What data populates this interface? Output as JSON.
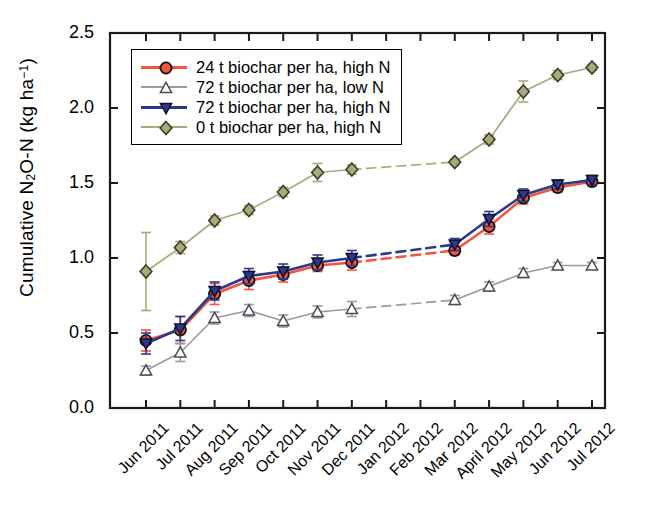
{
  "chart_data": {
    "type": "line",
    "title": "",
    "xlabel": "",
    "ylabel": "Cumulative N2O-N (kg ha-1)",
    "ylabel_parts": {
      "pre": "Cumulative N",
      "sub": "2",
      "mid": "O-N (kg ha",
      "sup": "−1",
      "post": ")"
    },
    "categories": [
      "Jun 2011",
      "Jul 2011",
      "Aug 2011",
      "Sep 2011",
      "Oct 2011",
      "Nov 2011",
      "Dec 2011",
      "Jan 2012",
      "Feb 2012",
      "Mar 2012",
      "April 2012",
      "May 2012",
      "Jun 2012",
      "Jul 2012"
    ],
    "ylim": [
      0.0,
      2.5
    ],
    "yticks": [
      "0.0",
      "0.5",
      "1.0",
      "1.5",
      "2.0",
      "2.5"
    ],
    "ytick_values": [
      0.0,
      0.5,
      1.0,
      1.5,
      2.0,
      2.5
    ],
    "grid": false,
    "legend_position": "upper left",
    "frame": "box",
    "series": [
      {
        "name": "24 t biochar per ha, high N",
        "color": "#F4543C",
        "marker": "circle",
        "marker_fill": "#F4543C",
        "x": [
          "Jun 2011",
          "Jul 2011",
          "Aug 2011",
          "Sep 2011",
          "Oct 2011",
          "Nov 2011",
          "Dec 2011",
          "Mar 2012",
          "April 2012",
          "May 2012",
          "Jun 2012",
          "Jul 2012"
        ],
        "values": [
          0.45,
          0.52,
          0.76,
          0.85,
          0.89,
          0.95,
          0.97,
          1.05,
          1.21,
          1.4,
          1.47,
          1.51
        ],
        "errors": [
          0.07,
          0.09,
          0.07,
          0.06,
          0.05,
          0.04,
          0.05,
          0.03,
          0.05,
          0.04,
          0.03,
          0.03
        ],
        "gap_after": "Dec 2011",
        "gap_style": "dashed"
      },
      {
        "name": "72 t biochar per ha, low N",
        "color": "#9A9AA0",
        "marker": "triangle-up",
        "marker_fill": "#FFFFFF",
        "x": [
          "Jun 2011",
          "Jul 2011",
          "Aug 2011",
          "Sep 2011",
          "Oct 2011",
          "Nov 2011",
          "Dec 2011",
          "Mar 2012",
          "April 2012",
          "May 2012",
          "Jun 2012",
          "Jul 2012"
        ],
        "values": [
          0.25,
          0.37,
          0.6,
          0.65,
          0.58,
          0.64,
          0.66,
          0.72,
          0.81,
          0.9,
          0.95,
          0.95
        ],
        "errors": [
          0.03,
          0.06,
          0.04,
          0.04,
          0.04,
          0.04,
          0.05,
          0.03,
          0.03,
          0.03,
          0.02,
          0.02
        ],
        "gap_after": "Dec 2011",
        "gap_style": "dashed"
      },
      {
        "name": "72 t biochar per ha, high N",
        "color": "#2B3A8F",
        "marker": "triangle-down",
        "marker_fill": "#2B3A8F",
        "x": [
          "Jun 2011",
          "Jul 2011",
          "Aug 2011",
          "Sep 2011",
          "Oct 2011",
          "Nov 2011",
          "Dec 2011",
          "Mar 2012",
          "April 2012",
          "May 2012",
          "Jun 2012",
          "Jul 2012"
        ],
        "values": [
          0.43,
          0.53,
          0.78,
          0.88,
          0.91,
          0.97,
          1.0,
          1.09,
          1.26,
          1.42,
          1.49,
          1.52
        ],
        "errors": [
          0.07,
          0.08,
          0.06,
          0.05,
          0.05,
          0.05,
          0.05,
          0.04,
          0.05,
          0.04,
          0.03,
          0.03
        ],
        "gap_after": "Dec 2011",
        "gap_style": "dashed"
      },
      {
        "name": "0 t biochar per ha, high N",
        "color": "#A9A97A",
        "marker": "diamond",
        "marker_fill": "#A9A97A",
        "x": [
          "Jun 2011",
          "Jul 2011",
          "Aug 2011",
          "Sep 2011",
          "Oct 2011",
          "Nov 2011",
          "Dec 2011",
          "Mar 2012",
          "April 2012",
          "May 2012",
          "Jun 2012",
          "Jul 2012"
        ],
        "values": [
          0.91,
          1.07,
          1.25,
          1.32,
          1.44,
          1.57,
          1.59,
          1.64,
          1.79,
          2.11,
          2.22,
          2.27
        ],
        "errors": [
          0.26,
          0.04,
          0.03,
          0.03,
          0.03,
          0.06,
          0.03,
          0.02,
          0.03,
          0.07,
          0.03,
          0.02
        ],
        "gap_after": "Dec 2011",
        "gap_style": "dashed"
      }
    ]
  },
  "legend": {
    "items": [
      {
        "label": "24 t biochar per ha, high N"
      },
      {
        "label": "72 t biochar per ha, low N"
      },
      {
        "label": "72 t biochar per ha, high N"
      },
      {
        "label": "0 t biochar per ha, high N"
      }
    ]
  }
}
